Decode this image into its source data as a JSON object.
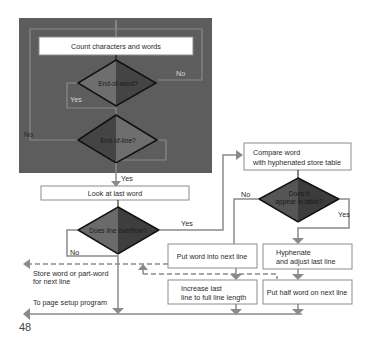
{
  "page_number": "48",
  "loop_panel": {
    "background": "#5b5b5b",
    "process": "Count characters and words",
    "decision_end_of_word": "End-of-word?",
    "decision_end_of_line": "End-of-line?",
    "label_no_word": "No",
    "label_yes_word": "Yes",
    "label_no_line": "No"
  },
  "main": {
    "label_yes_line": "Yes",
    "process_look": "Look at last word",
    "decision_overflow": "Does line overflow?",
    "label_yes_overflow": "Yes",
    "label_no_overflow": "No",
    "store_line1": "Store word or part-word",
    "store_line2": "for next line",
    "to_page_setup": "To page setup program"
  },
  "hyphen_branch": {
    "compare_line1": "Compare word",
    "compare_line2": "with hyphenated store table",
    "decision_line1": "Does it",
    "decision_line2": "appear in table?",
    "label_no": "No",
    "label_yes": "Yes",
    "put_next": "Put word into next line",
    "hyphenate_line1": "Hyphenate",
    "hyphenate_line2": "and adjust last line",
    "increase_line1": "Increase last",
    "increase_line2": "line to full line length",
    "put_half": "Put half word on next line"
  },
  "colors": {
    "line": "#8a8a8a",
    "box_border": "#8c8c8c",
    "diamond_light": "#6e6e6e",
    "diamond_dark": "#3e3e3e",
    "diamond_border": "#111111"
  }
}
